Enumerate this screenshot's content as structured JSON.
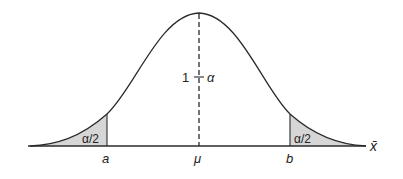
{
  "diagram": {
    "type": "normal-distribution-confidence-interval",
    "curve": "bell curve (normal density)",
    "center_label": "μ",
    "lower_bound_label": "a",
    "upper_bound_label": "b",
    "axis_label": "x̄",
    "center_area_label": {
      "left": "1",
      "operator": "−",
      "right": "α"
    },
    "left_tail_label": "α/2",
    "right_tail_label": "α/2",
    "colors": {
      "line": "#2b2b2b",
      "tail_fill": "#d6d6d6",
      "background": "#ffffff"
    }
  }
}
